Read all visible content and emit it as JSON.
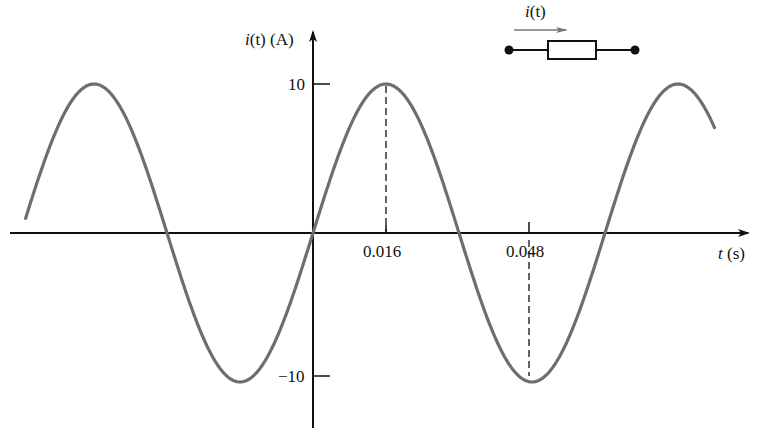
{
  "chart_data": {
    "type": "line",
    "title": "",
    "xlabel": "t (s)",
    "ylabel": "i(t) (A)",
    "function": "i(t) = 10 sin(2*pi*t/0.064)",
    "amplitude": 10,
    "period": 0.064,
    "x_range": [
      -0.063,
      0.088
    ],
    "ylim": [
      -10,
      10
    ],
    "x_ticks": [
      0.016,
      0.048
    ],
    "x_tick_labels": [
      "0.016",
      "0.048"
    ],
    "y_ticks": [
      10,
      -10
    ],
    "y_tick_labels": [
      "10",
      "-10"
    ],
    "annotations": [
      {
        "type": "dashed-line",
        "x": 0.016,
        "from_y": 0,
        "to_y": 10
      },
      {
        "type": "dashed-line",
        "x": 0.048,
        "from_y": 0,
        "to_y": -10
      }
    ],
    "key_points": [
      {
        "t": -0.048,
        "i": 10
      },
      {
        "t": -0.016,
        "i": -10
      },
      {
        "t": 0,
        "i": 0
      },
      {
        "t": 0.016,
        "i": 10
      },
      {
        "t": 0.032,
        "i": 0
      },
      {
        "t": 0.048,
        "i": -10
      },
      {
        "t": 0.064,
        "i": 0
      },
      {
        "t": 0.08,
        "i": 10
      }
    ],
    "grid": false,
    "legend": null
  },
  "axes": {
    "y_label_func": "i",
    "y_label_arg": "(t)",
    "y_label_unit": "(A)",
    "x_label_var": "t",
    "x_label_unit": "(s)",
    "y_tick_top": "10",
    "y_tick_bottom": "−10",
    "x_tick_1": "0.016",
    "x_tick_2": "0.048"
  },
  "inset": {
    "current_label_func": "i",
    "current_label_arg": "(t)",
    "element": "resistor"
  },
  "colors": {
    "curve": "#6e6e6e",
    "axis": "#111111"
  }
}
